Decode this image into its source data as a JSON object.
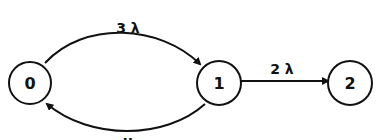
{
  "diagram": {
    "type": "state-transition",
    "nodes": [
      {
        "id": "0",
        "label": "0",
        "cx": 30,
        "cy": 83
      },
      {
        "id": "1",
        "label": "1",
        "cx": 219,
        "cy": 83
      },
      {
        "id": "2",
        "label": "2",
        "cx": 350,
        "cy": 83
      }
    ],
    "edges": [
      {
        "from": "0",
        "to": "1",
        "label": "3 λ"
      },
      {
        "from": "1",
        "to": "0",
        "label": "μ"
      },
      {
        "from": "1",
        "to": "2",
        "label": "2 λ"
      }
    ],
    "colors": {
      "stroke": "#111111",
      "background": "#ffffff"
    }
  }
}
